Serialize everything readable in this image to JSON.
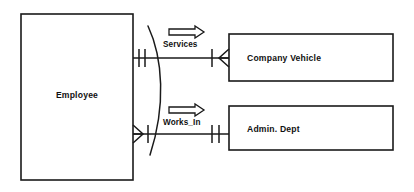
{
  "diagram": {
    "type": "entity-relationship",
    "notation": "crow's foot",
    "background_color": "#ffffff",
    "line_color": "#1a1a1a"
  },
  "entities": [
    {
      "id": "employee",
      "label": "Employee",
      "x": 21,
      "y": 14,
      "width": 112,
      "height": 166,
      "label_x": 77,
      "label_y": 98
    },
    {
      "id": "company_vehicle",
      "label": "Company Vehicle",
      "x": 229,
      "y": 34,
      "width": 164,
      "height": 47,
      "label_x": 247,
      "label_y": 61
    },
    {
      "id": "admin_dept",
      "label": "Admin. Dept",
      "x": 229,
      "y": 106,
      "width": 164,
      "height": 44,
      "label_x": 247,
      "label_y": 132
    }
  ],
  "relationships": [
    {
      "id": "services",
      "label": "Services",
      "label_x": 163,
      "label_y": 46,
      "from": "employee",
      "to": "company_vehicle",
      "line_y": 58,
      "line_x1": 133,
      "line_x2": 229,
      "from_cardinality": "one-and-only-one",
      "to_cardinality": "one-to-many",
      "direction_arrow": "right",
      "arrow_x": 169,
      "arrow_y": 31
    },
    {
      "id": "works_in",
      "label": "Works_In",
      "label_x": 163,
      "label_y": 124,
      "from": "employee",
      "to": "admin_dept",
      "line_y": 134,
      "line_x1": 133,
      "line_x2": 229,
      "from_cardinality": "many",
      "to_cardinality": "one-and-only-one",
      "direction_arrow": "right",
      "arrow_x": 169,
      "arrow_y": 110
    }
  ],
  "arc": {
    "id": "grouping-arc",
    "description": "curved arc spanning both relationship lines",
    "start_x": 148,
    "start_y": 26,
    "end_x": 150,
    "end_y": 155
  }
}
